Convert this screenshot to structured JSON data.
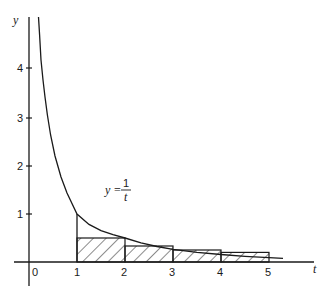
{
  "figure": {
    "x_axis_label": "t",
    "y_axis_label": "y",
    "origin_label": "0",
    "x_ticks": [
      "1",
      "2",
      "3",
      "4",
      "5"
    ],
    "y_ticks": [
      "1",
      "2",
      "3",
      "4"
    ],
    "curve_label": {
      "lhs": "y =",
      "numerator": "1",
      "denominator": "t"
    },
    "rectangles": [
      {
        "from": 1,
        "to": 2,
        "height": 0.5
      },
      {
        "from": 2,
        "to": 3,
        "height": 0.3333
      },
      {
        "from": 3,
        "to": 4,
        "height": 0.25
      },
      {
        "from": 4,
        "to": 5,
        "height": 0.2
      }
    ],
    "colors": {
      "ink": "#1a1a1a",
      "background": "#ffffff"
    }
  }
}
